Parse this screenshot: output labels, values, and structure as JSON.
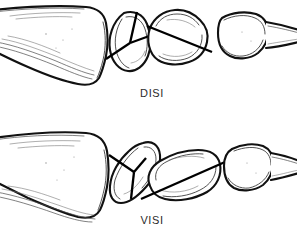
{
  "figure": {
    "background_color": "#ffffff",
    "ink_color": "#111111",
    "label_color": "#2b2b2b",
    "width": 297,
    "height": 238
  },
  "panels": [
    {
      "id": "disi",
      "label": "DISI",
      "label_x": 152,
      "label_y": 97,
      "description": "Dorsal intercalated segment instability - lunate axis tilted dorsally",
      "bones": [
        {
          "name": "radius",
          "axis_shown": false
        },
        {
          "name": "scaphoid",
          "axis_shown": true,
          "axis_type": "y-marker"
        },
        {
          "name": "lunate",
          "axis_shown": true,
          "axis_type": "long-axis",
          "tilt": "dorsal"
        },
        {
          "name": "capitate",
          "axis_shown": false
        }
      ]
    },
    {
      "id": "visi",
      "label": "VISI",
      "label_x": 152,
      "label_y": 224,
      "description": "Volar intercalated segment instability - lunate axis tilted volarly",
      "bones": [
        {
          "name": "radius",
          "axis_shown": false
        },
        {
          "name": "scaphoid",
          "axis_shown": true,
          "axis_type": "y-marker"
        },
        {
          "name": "lunate",
          "axis_shown": true,
          "axis_type": "long-axis",
          "tilt": "volar"
        },
        {
          "name": "capitate",
          "axis_shown": false
        }
      ]
    }
  ]
}
